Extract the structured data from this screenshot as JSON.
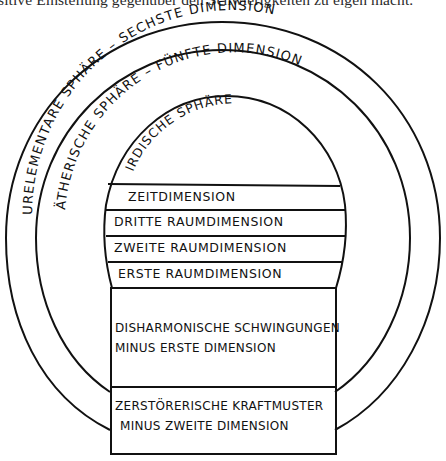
{
  "caption": "sitive Einstellung gegenüber den Schwierigkeiten zu eigen macht.",
  "diagram": {
    "outer_arc_label": "URELEMENTARE SPHÄRE – SECHSTE DIMENSION",
    "middle_arc_label": "ÄTHERISCHE SPHÄRE – FÜNFTE DIMENSION",
    "inner_arc_label": "IRDISCHE SPHÄRE",
    "bands": [
      {
        "label": "ZEITDIMENSION"
      },
      {
        "label": "DRITTE RAUMDIMENSION"
      },
      {
        "label": "ZWEITE RAUMDIMENSION"
      },
      {
        "label": "ERSTE RAUMDIMENSION"
      }
    ],
    "lower_boxes": [
      {
        "line1": "DISHARMONISCHE SCHWINGUNGEN",
        "line2": "MINUS ERSTE DIMENSION"
      },
      {
        "line1": "ZERSTÖRERISCHE KRAFTMUSTER",
        "line2": "MINUS ZWEITE DIMENSION"
      }
    ],
    "stroke_color": "#111111",
    "background_color": "#ffffff"
  }
}
